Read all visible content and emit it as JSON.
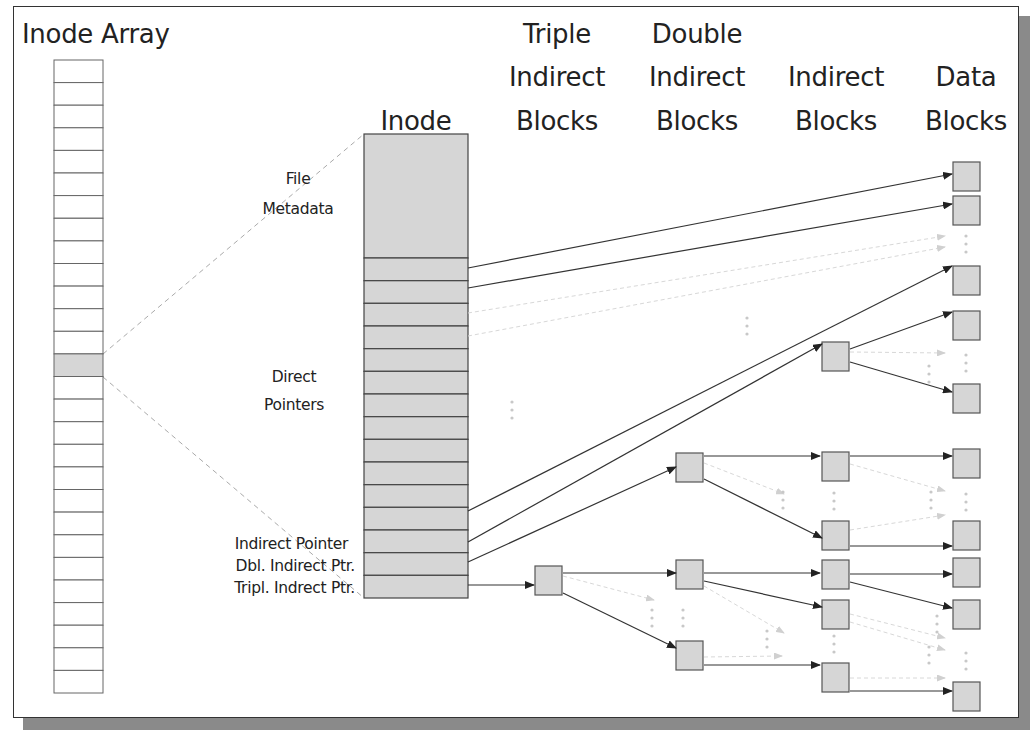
{
  "headers": {
    "inode_array": "Inode Array",
    "inode": "Inode",
    "triple": [
      "Triple",
      "Indirect",
      "Blocks"
    ],
    "double": [
      "Double",
      "Indirect",
      "Blocks"
    ],
    "indirect": [
      "Indirect",
      "Blocks"
    ],
    "data": [
      "Data",
      "Blocks"
    ]
  },
  "labels": {
    "file_metadata": [
      "File",
      "Metadata"
    ],
    "direct_pointers": [
      "Direct",
      "Pointers"
    ],
    "indirect_pointer": "Indirect Pointer",
    "dbl_indirect_ptr": "Dbl. Indirect Ptr.",
    "tripl_indirect_ptr": "Tripl. Indrect Ptr."
  },
  "inode_array": {
    "rows": 28,
    "selected_index": 13
  },
  "inode": {
    "direct_rows": 11,
    "pointer_rows": 4
  },
  "colors": {
    "block_fill": "#d6d6d6",
    "block_stroke": "#555555",
    "edge": "#333333",
    "frame_shadow": "#8a8a8a"
  }
}
